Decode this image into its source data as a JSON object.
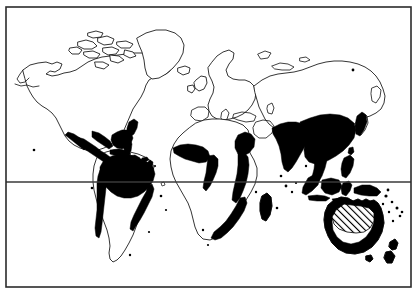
{
  "figure": {
    "kind": "world-distribution-map",
    "title": "",
    "caption": "",
    "width": 420,
    "height": 300,
    "background_color": "#ffffff",
    "frame": {
      "stroke_color": "#2b2b2b",
      "x": 6,
      "y": 7,
      "width": 405,
      "height": 280
    }
  },
  "projection": {
    "name": "equirectangular",
    "lon_min": -180,
    "lon_max": 180,
    "lat_min": -60,
    "lat_max": 84
  },
  "graticule": {
    "lines": [
      {
        "name": "equator",
        "label": "",
        "latitude": 0,
        "y": 182,
        "color": "#3a3a3a"
      }
    ]
  },
  "legend": {
    "visible": false,
    "entries": [
      {
        "key": "solid",
        "label": "",
        "fill": "#000000",
        "pattern": "solid"
      },
      {
        "key": "hatched",
        "label": "",
        "fill": "#000000",
        "pattern": "diagonal-hatch"
      }
    ]
  },
  "regions": {
    "solid_fill_color": "#000000",
    "hatch_fill_color": "#000000",
    "solid_named_areas": [
      "Mexico and Central America",
      "Caribbean islands",
      "Amazon Basin and northern South America",
      "Brazilian Atlantic coast",
      "Southeastern United States and Florida",
      "West African Guinea coast",
      "Horn of Africa and East African coast",
      "Southeastern Africa coast",
      "Madagascar",
      "Indian subcontinent",
      "Southeast Asia and southern China",
      "Indonesia and Malay Archipelago",
      "Philippines",
      "New Guinea",
      "Japanese Pacific coast",
      "Northern and eastern Australia coast",
      "New Zealand",
      "Pacific island groups"
    ],
    "hatched_named_areas": [
      "North-central Australia interior"
    ],
    "unshaded_named_areas": [
      "Canada and Alaska",
      "Greenland",
      "Europe",
      "North and Central Asia",
      "Sahara and North Africa",
      "Southern South America",
      "Arabian Peninsula interior"
    ]
  },
  "landmasses": [
    {
      "name": "north-america",
      "shaded": "partial"
    },
    {
      "name": "greenland",
      "shaded": "none"
    },
    {
      "name": "south-america",
      "shaded": "partial"
    },
    {
      "name": "africa",
      "shaded": "partial"
    },
    {
      "name": "europe",
      "shaded": "none"
    },
    {
      "name": "asia",
      "shaded": "partial"
    },
    {
      "name": "australia",
      "shaded": "partial-hatched"
    },
    {
      "name": "new-zealand",
      "shaded": "full"
    },
    {
      "name": "madagascar",
      "shaded": "full"
    },
    {
      "name": "japan",
      "shaded": "partial"
    },
    {
      "name": "indonesia",
      "shaded": "full"
    },
    {
      "name": "philippines",
      "shaded": "full"
    },
    {
      "name": "new-guinea",
      "shaded": "full"
    }
  ]
}
